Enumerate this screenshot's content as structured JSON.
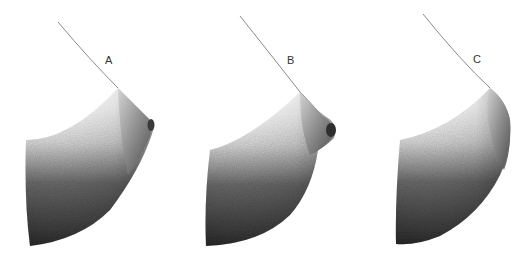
{
  "figures": [
    {
      "id": "A",
      "label": "A"
    },
    {
      "id": "B",
      "label": "B"
    },
    {
      "id": "C",
      "label": "C"
    }
  ],
  "colors": {
    "outline": "#8a8a8a",
    "shade_dark": "#2e2e2e",
    "shade_mid": "#6e6e6e",
    "shade_light": "#e8e8e8",
    "background": "#ffffff"
  }
}
